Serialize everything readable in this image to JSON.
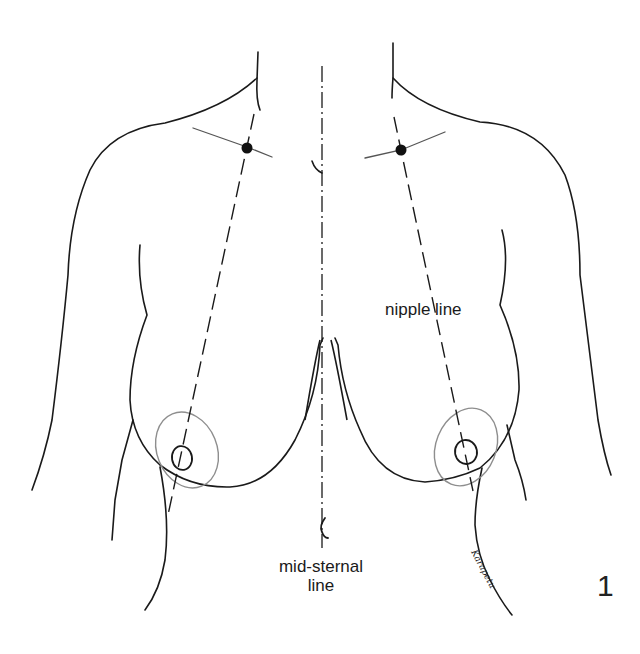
{
  "figure": {
    "type": "anatomical line drawing",
    "figure_number": "1",
    "labels": {
      "nipple_line": "nipple line",
      "mid_sternal_line_1": "mid-sternal",
      "mid_sternal_line_2": "line"
    },
    "artist_signature": "Karapetu",
    "markings": [
      {
        "name": "mid-sternal line",
        "style": "dash-dot",
        "orientation": "vertical"
      },
      {
        "name": "left nipple line",
        "style": "dashed",
        "from": "mid-clavicular point",
        "to": "below nipple"
      },
      {
        "name": "right nipple line",
        "style": "dashed",
        "from": "mid-clavicular point",
        "to": "below nipple"
      },
      {
        "name": "clavicle points",
        "style": "filled dot",
        "count": 2
      },
      {
        "name": "areola outlines",
        "style": "light ellipse",
        "count": 2
      }
    ],
    "colors": {
      "line": "#1a1a1a",
      "light_line": "#9a9a9a",
      "background": "#ffffff"
    }
  }
}
